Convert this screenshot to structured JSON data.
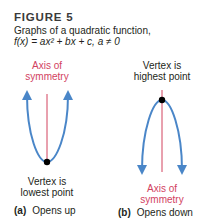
{
  "figure": {
    "label": "FIGURE 5",
    "caption_line1": "Graphs of a quadratic function,",
    "caption_line2": "f(x) = ax² + bx + c, a ≠ 0"
  },
  "panel_a": {
    "axis_label_1": "Axis of",
    "axis_label_2": "symmetry",
    "vertex_label_1": "Vertex is",
    "vertex_label_2": "lowest point",
    "letter": "(a)",
    "description": "Opens up"
  },
  "panel_b": {
    "vertex_label_1": "Vertex is",
    "vertex_label_2": "highest point",
    "axis_label_1": "Axis of",
    "axis_label_2": "symmetry",
    "letter": "(b)",
    "description": "Opens down"
  },
  "colors": {
    "curve": "#4a86c8",
    "axis": "#d2425f",
    "vertex": "#000000"
  }
}
